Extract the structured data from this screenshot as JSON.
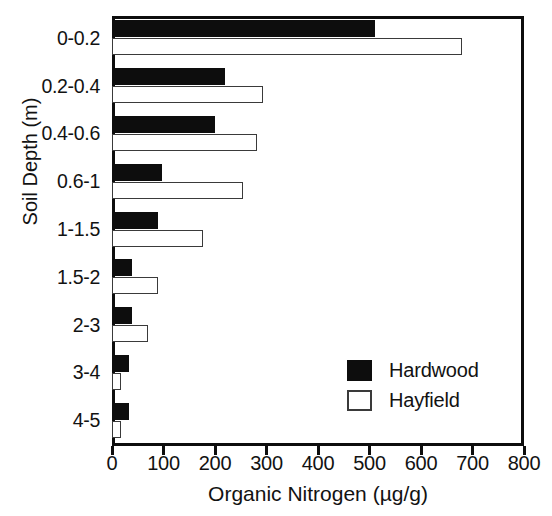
{
  "chart_data": {
    "type": "bar",
    "orientation": "horizontal",
    "title": "",
    "xlabel": "Organic Nitrogen (µg/g)",
    "ylabel": "Soil Depth (m)",
    "xlim": [
      0,
      800
    ],
    "xticks": [
      0,
      100,
      200,
      300,
      400,
      500,
      600,
      700,
      800
    ],
    "xtick_labels": [
      "0",
      "100",
      "200",
      "300",
      "400",
      "500",
      "600",
      "700",
      "800"
    ],
    "grid": false,
    "categories": [
      "0-0.2",
      "0.2-0.4",
      "0.4-0.6",
      "0.6-1",
      "1-1.5",
      "1.5-2",
      "2-3",
      "3-4",
      "4-5"
    ],
    "legend_position": "lower-right",
    "series": [
      {
        "name": "Hardwood",
        "color": "#0d0d0d",
        "fill": "solid",
        "values": [
          511,
          219,
          200,
          97,
          89,
          39,
          39,
          33,
          33
        ]
      },
      {
        "name": "Hayfield",
        "color": "#ffffff",
        "fill": "open",
        "edge_color": "#3a3a3a",
        "values": [
          680,
          293,
          281,
          254,
          176,
          89,
          70,
          17,
          17
        ]
      }
    ]
  },
  "axes": {
    "y_title": "Soil Depth (m)",
    "x_title": "Organic Nitrogen (µg/g)"
  },
  "legend": {
    "entries": [
      {
        "label": "Hardwood",
        "swatch": "filled-black-square"
      },
      {
        "label": "Hayfield",
        "swatch": "open-white-square"
      }
    ]
  },
  "colors": {
    "hardwood": "#0d0d0d",
    "hayfield_fill": "#ffffff",
    "hayfield_edge": "#3a3a3a",
    "frame": "#0d0d0d",
    "background": "#ffffff",
    "text": "#121212"
  }
}
